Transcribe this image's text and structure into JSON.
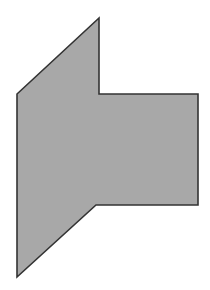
{
  "figure": {
    "title": "Gray arrow-like polygon",
    "caption": "",
    "background_color": "#ffffff",
    "canvas": {
      "width": 210,
      "height": 290
    }
  },
  "shape": {
    "name": "left-pointing-arrow-polygon",
    "kind": "polygon",
    "vertex_count": 8,
    "fill_color": "#a8a8a8",
    "stroke_color": "#333333",
    "stroke_width": 1.6,
    "points": "99,18 99,94 198,94 198,205 96,205 17,277 17,94 99,18",
    "vertices": [
      {
        "label": "top-apex",
        "x": 99,
        "y": 18
      },
      {
        "label": "notch-upper-inner",
        "x": 99,
        "y": 94
      },
      {
        "label": "arm-top-right",
        "x": 198,
        "y": 94
      },
      {
        "label": "arm-bottom-right",
        "x": 198,
        "y": 205
      },
      {
        "label": "notch-lower-inner",
        "x": 96,
        "y": 205
      },
      {
        "label": "bottom-apex",
        "x": 17,
        "y": 277
      },
      {
        "label": "left-middle",
        "x": 17,
        "y": 94
      }
    ]
  }
}
